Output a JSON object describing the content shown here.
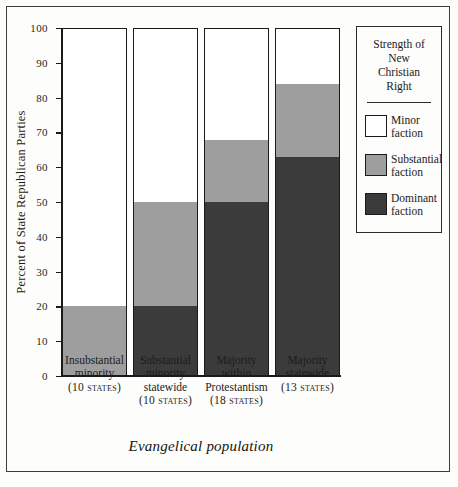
{
  "chart_data": {
    "type": "bar",
    "subtype": "stacked-bar",
    "title": "",
    "xlabel": "Evangelical population",
    "ylabel": "Percent of State Republican Parties",
    "ylim": [
      0,
      100
    ],
    "ytick_labels": [
      "100",
      "90",
      "80",
      "70",
      "60",
      "50",
      "40",
      "30",
      "20",
      "10",
      "0"
    ],
    "ytick_values": [
      100,
      90,
      80,
      70,
      60,
      50,
      40,
      30,
      20,
      10,
      0
    ],
    "grid": false,
    "legend_position": "right",
    "categories": [
      "Insubstantial minority",
      "Substantial minority statewide",
      "Majority within Protestantism",
      "Majority statewide"
    ],
    "category_labels": [
      {
        "line1": "Insubstantial",
        "line2": "minority",
        "line3": "",
        "count": "(10 states)"
      },
      {
        "line1": "Substantial",
        "line2": "minority",
        "line3": "statewide",
        "count": "(10 states)"
      },
      {
        "line1": "Majority",
        "line2": "within",
        "line3": "Protestantism",
        "count": "(18 states)"
      },
      {
        "line1": "Majority",
        "line2": "statewide",
        "line3": "",
        "count": "(13 states)"
      }
    ],
    "series": [
      {
        "name": "Dominant faction",
        "color": "#3b3b3b",
        "values": [
          0,
          20,
          50,
          63
        ]
      },
      {
        "name": "Substantial faction",
        "color": "#9e9e9e",
        "values": [
          20,
          30,
          18,
          21
        ]
      },
      {
        "name": "Minor faction",
        "color": "#ffffff",
        "values": [
          80,
          50,
          32,
          16
        ]
      }
    ]
  },
  "legend": {
    "title_lines": [
      "Strength of",
      "New",
      "Christian",
      "Right"
    ],
    "items": [
      {
        "label_line1": "Minor",
        "label_line2": "faction",
        "color": "#ffffff"
      },
      {
        "label_line1": "Substantial",
        "label_line2": "faction",
        "color": "#9e9e9e"
      },
      {
        "label_line1": "Dominant",
        "label_line2": "faction",
        "color": "#3b3b3b"
      }
    ]
  }
}
